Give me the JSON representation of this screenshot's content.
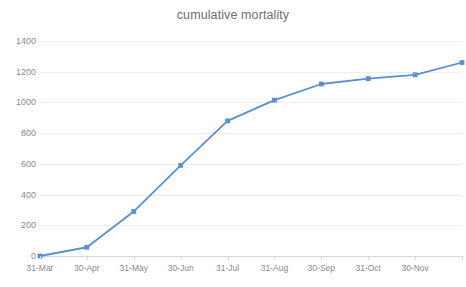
{
  "chart_data": {
    "type": "line",
    "title": "cumulative mortality",
    "xlabel": "",
    "ylabel": "",
    "categories": [
      "31-Mar",
      "30-Apr",
      "31-May",
      "30-Jun",
      "31-Jul",
      "31-Aug",
      "30-Sep",
      "31-Oct",
      "30-Nov",
      ""
    ],
    "values": [
      0,
      57,
      290,
      590,
      880,
      1015,
      1120,
      1155,
      1180,
      1260
    ],
    "series": [
      {
        "name": "cumulative mortality",
        "values": [
          0,
          57,
          290,
          590,
          880,
          1015,
          1120,
          1155,
          1180,
          1260
        ]
      }
    ],
    "ylim": [
      0,
      1400
    ],
    "ytick_values": [
      0,
      200,
      400,
      600,
      800,
      1000,
      1200,
      1400
    ],
    "ytick_labels": [
      "0",
      "200",
      "400",
      "600",
      "800",
      "1000",
      "1200",
      "1400"
    ],
    "xtick_labels": [
      "31-Mar",
      "30-Apr",
      "31-May",
      "30-Jun",
      "31-Jul",
      "31-Aug",
      "30-Sep",
      "31-Oct",
      "30-Nov"
    ],
    "grid": true,
    "grid_axis": "y",
    "legend": false,
    "legend_position": "none",
    "marker": "square",
    "line_color": "#5B8FD0",
    "marker_color": "#5B8FD0",
    "grid_color": "#EDEDF2",
    "axis_color": "#D6D6DE",
    "title_color": "#6E6E6E",
    "tick_label_color": "#8A8A8A",
    "background_color": "#FFFFFF"
  }
}
